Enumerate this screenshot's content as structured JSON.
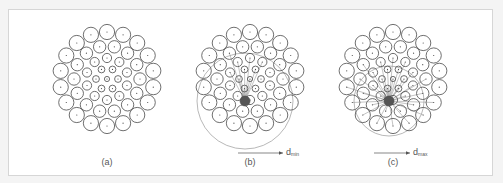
{
  "figure": {
    "panels": [
      {
        "id": "a",
        "label": "(a)",
        "cx": 107,
        "cy": 79,
        "mode": "plain"
      },
      {
        "id": "b",
        "label": "(b)",
        "cx": 250,
        "cy": 79,
        "mode": "dmin",
        "focus_dx": -5,
        "focus_dy": 22,
        "range_radius": 48,
        "arrow_label": "d",
        "arrow_sub": "min"
      },
      {
        "id": "c",
        "label": "(c)",
        "cx": 393,
        "cy": 79,
        "mode": "dmax",
        "focus_dx": -4,
        "focus_dy": 22,
        "range_radius": 35,
        "arrow_label": "d",
        "arrow_sub": "max"
      }
    ],
    "rings": [
      {
        "count": 18,
        "radius": 47,
        "r": 7.6
      },
      {
        "count": 14,
        "radius": 33,
        "r": 6.2
      },
      {
        "count": 10,
        "radius": 21,
        "r": 4.6
      },
      {
        "count": 6,
        "radius": 11,
        "r": 3.4
      }
    ],
    "center_circle_r": 2.6,
    "colors": {
      "stroke": "#4a4a4a",
      "focus": "#555555",
      "faint": "#9a9a9a",
      "frame": "#d6d6d6"
    }
  }
}
